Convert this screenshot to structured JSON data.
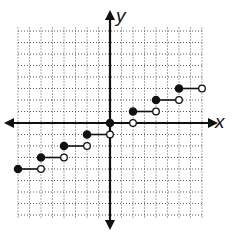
{
  "chart_data": {
    "type": "line",
    "subtype": "step-function",
    "title": "",
    "xlabel": "x",
    "ylabel": "y",
    "xlim": [
      -8,
      8
    ],
    "ylim": [
      -8,
      8
    ],
    "grid": true,
    "grid_style": "dotted",
    "tick_labels": false,
    "segments": [
      {
        "x_start": -8,
        "x_end": -6,
        "y": -4,
        "start": "closed",
        "end": "open"
      },
      {
        "x_start": -6,
        "x_end": -4,
        "y": -3,
        "start": "closed",
        "end": "open"
      },
      {
        "x_start": -4,
        "x_end": -2,
        "y": -2,
        "start": "closed",
        "end": "open"
      },
      {
        "x_start": -2,
        "x_end": 0,
        "y": -1,
        "start": "closed",
        "end": "open"
      },
      {
        "x_start": 0,
        "x_end": 2,
        "y": 0,
        "start": "closed",
        "end": "open"
      },
      {
        "x_start": 2,
        "x_end": 4,
        "y": 1,
        "start": "closed",
        "end": "open"
      },
      {
        "x_start": 4,
        "x_end": 6,
        "y": 2,
        "start": "closed",
        "end": "open"
      },
      {
        "x_start": 6,
        "x_end": 8,
        "y": 3,
        "start": "closed",
        "end": "open"
      }
    ]
  },
  "labels": {
    "x_axis": "x",
    "y_axis": "y"
  },
  "colors": {
    "ink": "#111111",
    "grid": "#555555",
    "background": "#ffffff"
  }
}
